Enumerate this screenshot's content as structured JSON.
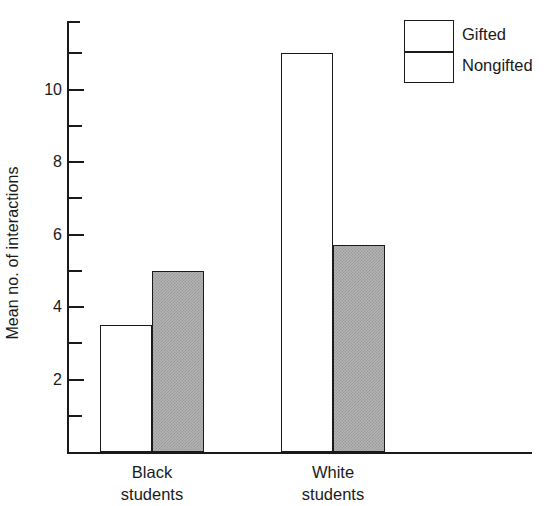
{
  "chart_data": {
    "type": "bar",
    "title": "",
    "subtitle": "",
    "xlabel": "",
    "ylabel": "Mean no. of interactions",
    "categories": [
      "Black\nstudents",
      "White\nstudents"
    ],
    "category_labels_flat": [
      "Black students",
      "White students"
    ],
    "series": [
      {
        "name": "Gifted",
        "values": [
          3.5,
          11.0
        ],
        "fill": "white",
        "color": "#ffffff"
      },
      {
        "name": "Nongifted",
        "values": [
          5.0,
          5.7
        ],
        "fill": "gray-dither",
        "color": "#b3b3b3"
      }
    ],
    "ylim": [
      0,
      11.9
    ],
    "ytick_major": [
      2,
      4,
      6,
      8,
      10
    ],
    "ytick_minor": [
      1,
      3,
      5,
      7,
      9,
      11
    ],
    "ytick_labels": [
      "2",
      "4",
      "6",
      "8",
      "10"
    ],
    "grid": false,
    "legend_position": "top-right",
    "axis_color": "#1a1a1a",
    "background": "#ffffff"
  },
  "legend": {
    "entries": [
      {
        "label": "Gifted"
      },
      {
        "label": "Nongifted"
      }
    ]
  },
  "axis": {
    "y_title": "Mean no. of interactions"
  }
}
